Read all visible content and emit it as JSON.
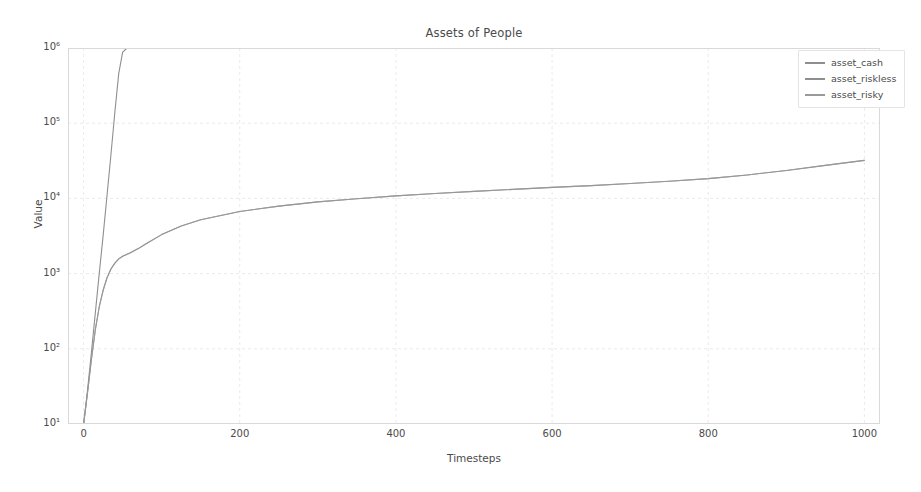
{
  "chart_data": {
    "type": "line",
    "title": "Assets of People",
    "xlabel": "Timesteps",
    "ylabel": "Value",
    "xlim": [
      -20,
      1020
    ],
    "ylim": [
      10,
      1000000
    ],
    "yscale": "log",
    "xscale": "linear",
    "grid": true,
    "legend_position": "upper right",
    "xticks": [
      "0",
      "200",
      "400",
      "600",
      "800",
      "1000"
    ],
    "xtick_values": [
      0,
      200,
      400,
      600,
      800,
      1000
    ],
    "yticks": [
      "10¹",
      "10²",
      "10³",
      "10⁴",
      "10⁵",
      "10⁶"
    ],
    "ytick_values": [
      10,
      100,
      1000,
      10000,
      100000,
      1000000
    ],
    "x": [
      0,
      5,
      10,
      15,
      20,
      25,
      30,
      35,
      40,
      45,
      50,
      55,
      60,
      70,
      80,
      100,
      125,
      150,
      200,
      250,
      300,
      350,
      400,
      450,
      500,
      550,
      600,
      650,
      700,
      750,
      800,
      850,
      900,
      950,
      1000
    ],
    "series": [
      {
        "name": "asset_cash",
        "color": "#8f8f8f",
        "values": [
          10,
          28,
          90,
          300,
          1000,
          3200,
          11000,
          38000,
          140000,
          460000,
          880000,
          985000,
          1000000,
          1000000,
          1000000,
          1000000,
          1000000,
          1000000,
          1000000,
          1000000,
          1000000,
          1000000,
          1000000,
          1000000,
          1000000,
          1000000,
          1000000,
          1000000,
          1000000,
          1000000,
          1000000,
          1000000,
          1000000,
          1000000,
          1000000
        ]
      },
      {
        "name": "asset_riskless",
        "color": "#8f8f8f",
        "values": [
          10,
          26,
          72,
          180,
          360,
          600,
          880,
          1150,
          1380,
          1570,
          1700,
          1790,
          1900,
          2150,
          2500,
          3300,
          4300,
          5200,
          6700,
          7900,
          9000,
          9900,
          10800,
          11600,
          12400,
          13200,
          14000,
          14800,
          15800,
          16900,
          18300,
          20500,
          23500,
          27500,
          32000
        ]
      },
      {
        "name": "asset_risky",
        "color": "#9a9a9a",
        "values": [
          10,
          26,
          72,
          180,
          360,
          600,
          880,
          1150,
          1380,
          1570,
          1700,
          1790,
          1900,
          2150,
          2500,
          3300,
          4300,
          5200,
          6700,
          7900,
          9000,
          9900,
          10800,
          11600,
          12400,
          13200,
          14000,
          14800,
          15800,
          16900,
          18300,
          20500,
          23500,
          27500,
          32000
        ]
      }
    ]
  },
  "legend": {
    "items": [
      {
        "label": "asset_cash"
      },
      {
        "label": "asset_riskless"
      },
      {
        "label": "asset_risky"
      }
    ]
  },
  "axes": {
    "title": "Assets of People",
    "xlabel": "Timesteps",
    "ylabel": "Value"
  }
}
